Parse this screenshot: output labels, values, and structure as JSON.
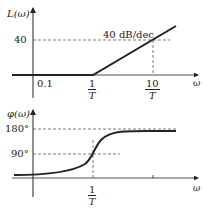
{
  "magnitude_plot": {
    "ylabel": "L(ω)",
    "xlabel": "ω",
    "y_tick": "40",
    "x_ticks": {
      "t1": "0.1",
      "t2_num": "1",
      "t2_den": "T",
      "t3_num": "10",
      "t3_den": "T"
    },
    "slope_label": "40 dB/dec"
  },
  "phase_plot": {
    "ylabel": "φ(ω)",
    "xlabel": "ω",
    "y_ticks": {
      "high": "180°",
      "mid": "90°"
    },
    "x_tick": {
      "num": "1",
      "den": "T"
    }
  },
  "colors": {
    "line": "#222222",
    "dash": "#444444"
  }
}
